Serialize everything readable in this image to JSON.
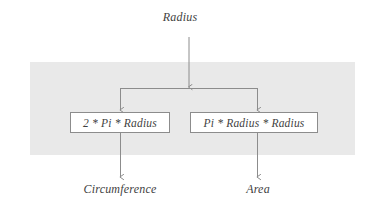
{
  "diagram": {
    "type": "flowchart",
    "title_label": "Radius",
    "band_color": "#e9e9e9",
    "line_color": "#8c8c8c",
    "background_color": "#ffffff",
    "input": {
      "label": "Radius"
    },
    "processes": [
      {
        "id": "circumference-formula",
        "label": "2 * Pi * Radius"
      },
      {
        "id": "area-formula",
        "label": "Pi * Radius * Radius"
      }
    ],
    "outputs": [
      {
        "id": "circumference-output",
        "label": "Circumference"
      },
      {
        "id": "area-output",
        "label": "Area"
      }
    ]
  }
}
